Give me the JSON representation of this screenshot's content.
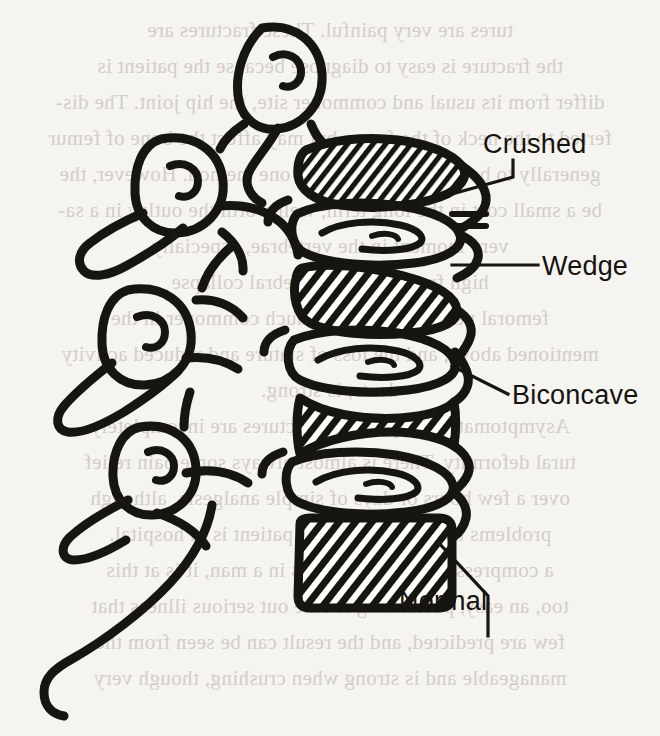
{
  "figure": {
    "ink_color": "#17150f",
    "page_color": "#f6f4f1",
    "bleed_text_color": "#cdc8c2",
    "view": "lateral (side) view, anterior to the right",
    "width": 660,
    "height": 736
  },
  "labels": [
    {
      "id": "crushed",
      "text": "Crushed",
      "description": "severely compressed, flattened vertebral body",
      "leader": "elbow: diagonal from body then vertical up to text"
    },
    {
      "id": "wedge",
      "text": "Wedge",
      "description": "anterior height loss giving a triangular wedge shape",
      "leader": "horizontal straight line"
    },
    {
      "id": "biconcave",
      "text": "Biconcave",
      "description": "central endplate depression, hourglass profile",
      "leader": "single diagonal line up to the right"
    },
    {
      "id": "normal",
      "text": "Normal",
      "description": "intact rectangular vertebral body",
      "leader": "diagonal then vertical down to text"
    }
  ],
  "anatomy": {
    "vertebral_bodies": [
      {
        "order": 1,
        "type": "Crushed",
        "fill": "diagonal-hatch"
      },
      {
        "order": 2,
        "type": "Wedge",
        "fill": "diagonal-hatch"
      },
      {
        "order": 3,
        "type": "Biconcave",
        "fill": "diagonal-hatch"
      },
      {
        "order": 4,
        "type": "Normal",
        "fill": "diagonal-hatch"
      }
    ],
    "intervertebral_discs": 3,
    "spinous_processes": 4,
    "transverse_processes": 2
  },
  "bleed_lines": [
    "tures are very painful. These fractures are",
    "the fracture is easy to diagnose because the patient is",
    "differ from its usual and commoner site, the hip joint. The dis-",
    "ferred to the neck of the femur but may affect the bone of femur",
    "generally to be made by more than one method. However, the",
    "be a small cost in the long term, well worth the outlay in a sa-",
    "very moment in the vertebrae, especially",
    "high frequency of vertebral collapse",
    "femoral neck fractures are much commoner in the",
    "mentioned above, and the loss of stature and reduced activity",
    "dents, is strong.",
    "Asymptomatic compression fractures are incompletely",
    "tural deformity. There is almost always some pain relief",
    "over a few hours or days of simple analgesia, although",
    "problems that arise when the patient is in hospital.",
    "a compression fracture occurs in a man, it is at this",
    "too, an easy, postulating to rule out serious illness that",
    "few are predicted, and the result can be seen from the",
    "manageable and is strong when crushing, though very"
  ]
}
